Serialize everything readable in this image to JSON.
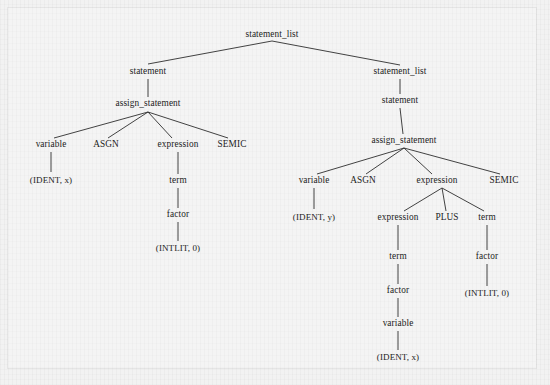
{
  "figure": {
    "background_color": "#f4f4f4",
    "text_color": "#1c1c1c",
    "edge_color": "#2e2e2e"
  },
  "tree": {
    "nodes": [
      {
        "id": "n0",
        "label": "statement_list",
        "x": 272,
        "y": 35,
        "kind": "nonterminal"
      },
      {
        "id": "n1",
        "label": "statement",
        "x": 148,
        "y": 72,
        "kind": "nonterminal"
      },
      {
        "id": "n2",
        "label": "assign_statement",
        "x": 148,
        "y": 104,
        "kind": "nonterminal"
      },
      {
        "id": "n3",
        "label": "variable",
        "x": 51,
        "y": 145,
        "kind": "nonterminal"
      },
      {
        "id": "n4",
        "label": "ASGN",
        "x": 106,
        "y": 145,
        "kind": "terminal"
      },
      {
        "id": "n5",
        "label": "expression",
        "x": 178,
        "y": 145,
        "kind": "nonterminal"
      },
      {
        "id": "n6",
        "label": "SEMIC",
        "x": 232,
        "y": 145,
        "kind": "terminal"
      },
      {
        "id": "n7",
        "label": "(IDENT, x)",
        "x": 51,
        "y": 180,
        "kind": "token"
      },
      {
        "id": "n8",
        "label": "term",
        "x": 178,
        "y": 181,
        "kind": "nonterminal"
      },
      {
        "id": "n9",
        "label": "factor",
        "x": 178,
        "y": 215,
        "kind": "nonterminal"
      },
      {
        "id": "n10",
        "label": "(INTLIT, 0)",
        "x": 178,
        "y": 248,
        "kind": "token"
      },
      {
        "id": "n11",
        "label": "statement_list",
        "x": 400,
        "y": 72,
        "kind": "nonterminal"
      },
      {
        "id": "n12",
        "label": "statement",
        "x": 400,
        "y": 101,
        "kind": "nonterminal"
      },
      {
        "id": "n13",
        "label": "assign_statement",
        "x": 404,
        "y": 141,
        "kind": "nonterminal"
      },
      {
        "id": "n14",
        "label": "variable",
        "x": 314,
        "y": 181,
        "kind": "nonterminal"
      },
      {
        "id": "n15",
        "label": "ASGN",
        "x": 363,
        "y": 181,
        "kind": "terminal"
      },
      {
        "id": "n16",
        "label": "expression",
        "x": 437,
        "y": 181,
        "kind": "nonterminal"
      },
      {
        "id": "n17",
        "label": "SEMIC",
        "x": 504,
        "y": 181,
        "kind": "terminal"
      },
      {
        "id": "n18",
        "label": "(IDENT, y)",
        "x": 314,
        "y": 217,
        "kind": "token"
      },
      {
        "id": "n19",
        "label": "expression",
        "x": 398,
        "y": 218,
        "kind": "nonterminal"
      },
      {
        "id": "n20",
        "label": "PLUS",
        "x": 447,
        "y": 218,
        "kind": "terminal"
      },
      {
        "id": "n21",
        "label": "term",
        "x": 487,
        "y": 218,
        "kind": "nonterminal"
      },
      {
        "id": "n22",
        "label": "term",
        "x": 398,
        "y": 257,
        "kind": "nonterminal"
      },
      {
        "id": "n23",
        "label": "factor",
        "x": 398,
        "y": 291,
        "kind": "nonterminal"
      },
      {
        "id": "n24",
        "label": "variable",
        "x": 398,
        "y": 324,
        "kind": "nonterminal"
      },
      {
        "id": "n25",
        "label": "(IDENT, x)",
        "x": 398,
        "y": 357,
        "kind": "token"
      },
      {
        "id": "n26",
        "label": "factor",
        "x": 487,
        "y": 257,
        "kind": "nonterminal"
      },
      {
        "id": "n27",
        "label": "(INTLIT, 0)",
        "x": 487,
        "y": 293,
        "kind": "token"
      }
    ],
    "edges": [
      {
        "from": "n0",
        "to": "n1",
        "x1": 272,
        "y1": 41,
        "x2": 148,
        "y2": 64
      },
      {
        "from": "n0",
        "to": "n11",
        "x1": 272,
        "y1": 41,
        "x2": 400,
        "y2": 65
      },
      {
        "from": "n1",
        "to": "n2",
        "x1": 148,
        "y1": 79,
        "x2": 148,
        "y2": 97
      },
      {
        "from": "n2",
        "to": "n3",
        "x1": 148,
        "y1": 112,
        "x2": 54,
        "y2": 138
      },
      {
        "from": "n2",
        "to": "n4",
        "x1": 148,
        "y1": 112,
        "x2": 108,
        "y2": 138
      },
      {
        "from": "n2",
        "to": "n5",
        "x1": 148,
        "y1": 112,
        "x2": 172,
        "y2": 138
      },
      {
        "from": "n2",
        "to": "n6",
        "x1": 148,
        "y1": 112,
        "x2": 228,
        "y2": 138
      },
      {
        "from": "n3",
        "to": "n7",
        "x1": 51,
        "y1": 152,
        "x2": 51,
        "y2": 172
      },
      {
        "from": "n5",
        "to": "n8",
        "x1": 178,
        "y1": 152,
        "x2": 178,
        "y2": 174
      },
      {
        "from": "n8",
        "to": "n9",
        "x1": 178,
        "y1": 188,
        "x2": 178,
        "y2": 208
      },
      {
        "from": "n9",
        "to": "n10",
        "x1": 178,
        "y1": 222,
        "x2": 178,
        "y2": 241
      },
      {
        "from": "n11",
        "to": "n12",
        "x1": 400,
        "y1": 79,
        "x2": 400,
        "y2": 94
      },
      {
        "from": "n12",
        "to": "n13",
        "x1": 400,
        "y1": 108,
        "x2": 403,
        "y2": 134
      },
      {
        "from": "n13",
        "to": "n14",
        "x1": 404,
        "y1": 148,
        "x2": 317,
        "y2": 174
      },
      {
        "from": "n13",
        "to": "n15",
        "x1": 404,
        "y1": 148,
        "x2": 366,
        "y2": 174
      },
      {
        "from": "n13",
        "to": "n16",
        "x1": 404,
        "y1": 148,
        "x2": 432,
        "y2": 174
      },
      {
        "from": "n13",
        "to": "n17",
        "x1": 404,
        "y1": 148,
        "x2": 500,
        "y2": 174
      },
      {
        "from": "n14",
        "to": "n18",
        "x1": 314,
        "y1": 188,
        "x2": 314,
        "y2": 209
      },
      {
        "from": "n16",
        "to": "n19",
        "x1": 442,
        "y1": 188,
        "x2": 404,
        "y2": 211
      },
      {
        "from": "n16",
        "to": "n20",
        "x1": 442,
        "y1": 188,
        "x2": 446,
        "y2": 211
      },
      {
        "from": "n16",
        "to": "n21",
        "x1": 442,
        "y1": 188,
        "x2": 484,
        "y2": 211
      },
      {
        "from": "n19",
        "to": "n22",
        "x1": 398,
        "y1": 225,
        "x2": 398,
        "y2": 250
      },
      {
        "from": "n22",
        "to": "n23",
        "x1": 398,
        "y1": 264,
        "x2": 398,
        "y2": 284
      },
      {
        "from": "n23",
        "to": "n24",
        "x1": 398,
        "y1": 298,
        "x2": 398,
        "y2": 317
      },
      {
        "from": "n24",
        "to": "n25",
        "x1": 398,
        "y1": 331,
        "x2": 398,
        "y2": 350
      },
      {
        "from": "n21",
        "to": "n26",
        "x1": 487,
        "y1": 225,
        "x2": 487,
        "y2": 250
      },
      {
        "from": "n26",
        "to": "n27",
        "x1": 487,
        "y1": 264,
        "x2": 487,
        "y2": 286
      }
    ]
  }
}
